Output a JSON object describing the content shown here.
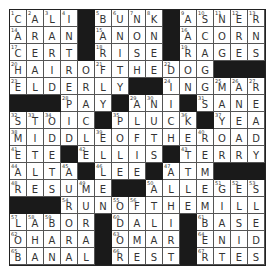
{
  "puzzle": {
    "size": 15,
    "rows": [
      "CALI#BUNK#ASNER",
      "ARAN#ANON#ACORN",
      "CERT#RISE#RAGES",
      "HAIROFTHEDOG###",
      "ELDERLY##INGMAR",
      "###PAY#ANI#SANE",
      "STOIC#PLUCK#YEA",
      "MIDDLEOFTHEROAD",
      "ETE#ELLIS#TERRY",
      "ALTA#LEE#ATM###",
      "RESUME##ALLEGES",
      "###RUNOFTHEMILL",
      "LABOR#DALI#BASE",
      "OHARA#OMAR#ENID",
      "BANAL#REST#RTES"
    ],
    "numbers": {
      "0,0": "1",
      "0,1": "2",
      "0,2": "3",
      "0,3": "4",
      "0,5": "5",
      "0,6": "6",
      "0,7": "7",
      "0,8": "8",
      "0,10": "9",
      "0,11": "10",
      "0,12": "11",
      "0,13": "12",
      "0,14": "13",
      "1,0": "14",
      "1,5": "15",
      "1,10": "16",
      "2,0": "17",
      "2,5": "18",
      "2,10": "19",
      "3,0": "20",
      "3,5": "21",
      "3,9": "22",
      "4,0": "23",
      "4,9": "24",
      "4,12": "25",
      "4,13": "26",
      "4,14": "27",
      "5,3": "28",
      "5,7": "29",
      "5,8": "30",
      "5,11": "31",
      "6,0": "32",
      "6,1": "33",
      "6,2": "34",
      "6,6": "35",
      "6,10": "36",
      "6,12": "37",
      "7,0": "38",
      "7,5": "39",
      "7,11": "40",
      "8,0": "41",
      "8,4": "42",
      "8,10": "43",
      "9,0": "44",
      "9,3": "45",
      "9,5": "46",
      "9,9": "47",
      "10,0": "48",
      "10,4": "49",
      "10,8": "50",
      "10,12": "51",
      "10,13": "52",
      "10,14": "53",
      "11,3": "54",
      "11,6": "55",
      "11,7": "56",
      "12,0": "57",
      "12,1": "58",
      "12,2": "59",
      "12,6": "60",
      "12,11": "61",
      "13,0": "62",
      "13,6": "63",
      "13,11": "64",
      "14,0": "65",
      "14,6": "66",
      "14,11": "67"
    },
    "colors": {
      "block": "#1a1a1a",
      "cell": "#ffffff",
      "text": "#333333",
      "border": "#555555"
    }
  }
}
